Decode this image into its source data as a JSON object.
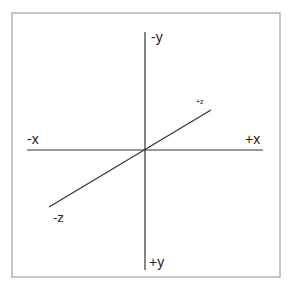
{
  "diagram": {
    "type": "3d-coordinate-axes",
    "labels": {
      "neg_y": "-y",
      "pos_y": "+y",
      "neg_x": "-x",
      "pos_x": "+x",
      "pos_z": "+z",
      "neg_z": "-z"
    },
    "colors": {
      "line": "#333333",
      "frame": "#8a8a8a",
      "background": "#ffffff"
    }
  }
}
